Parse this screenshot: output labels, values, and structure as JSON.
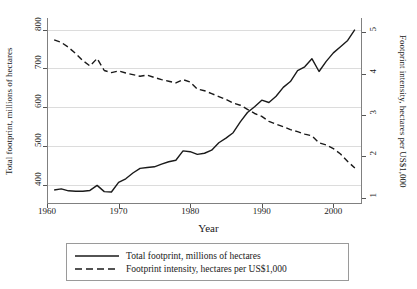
{
  "chart_data": {
    "type": "line",
    "title": "",
    "xlabel": "Year",
    "ylabel": "Total footprint, millions of hectares",
    "ylabel_right": "Footprint intensity, hectares per US$1,000",
    "xlim": [
      1960,
      2004
    ],
    "ylim": [
      350,
      830
    ],
    "ylim_right": [
      0.85,
      5.35
    ],
    "xticks": [
      1960,
      1970,
      1980,
      1990,
      2000
    ],
    "yticks": [
      400,
      500,
      600,
      700,
      800
    ],
    "yticks_right": [
      1,
      2,
      3,
      4,
      5
    ],
    "grid": true,
    "legend_position": "below-center",
    "x": [
      1961,
      1962,
      1963,
      1964,
      1965,
      1966,
      1967,
      1968,
      1969,
      1970,
      1971,
      1972,
      1973,
      1974,
      1975,
      1976,
      1977,
      1978,
      1979,
      1980,
      1981,
      1982,
      1983,
      1984,
      1985,
      1986,
      1987,
      1988,
      1989,
      1990,
      1991,
      1992,
      1993,
      1994,
      1995,
      1996,
      1997,
      1998,
      1999,
      2000,
      2001,
      2002,
      2003
    ],
    "series": [
      {
        "name": "Total footprint, millions of hectares",
        "style": "solid",
        "axis": "left",
        "color": "#1a1a1a",
        "values": [
          386,
          389,
          384,
          383,
          383,
          385,
          398,
          382,
          381,
          406,
          415,
          430,
          442,
          444,
          446,
          453,
          459,
          463,
          487,
          485,
          478,
          481,
          489,
          508,
          520,
          534,
          562,
          586,
          601,
          618,
          612,
          628,
          651,
          666,
          694,
          704,
          725,
          692,
          718,
          740,
          756,
          772,
          800
        ]
      },
      {
        "name": "Footprint intensity, hectares per US$1,000",
        "style": "dashed",
        "axis": "right",
        "color": "#1a1a1a",
        "values": [
          4.82,
          4.76,
          4.64,
          4.49,
          4.32,
          4.19,
          4.37,
          4.08,
          4.03,
          4.07,
          4.02,
          3.98,
          3.94,
          3.97,
          3.91,
          3.86,
          3.82,
          3.78,
          3.86,
          3.8,
          3.63,
          3.59,
          3.52,
          3.45,
          3.38,
          3.29,
          3.24,
          3.14,
          3.04,
          2.97,
          2.85,
          2.78,
          2.72,
          2.65,
          2.6,
          2.54,
          2.5,
          2.33,
          2.28,
          2.19,
          2.06,
          1.88,
          1.72
        ]
      }
    ],
    "legend": [
      {
        "label": "Total footprint, millions of hectares",
        "style": "solid"
      },
      {
        "label": "Footprint intensity, hectares per US$1,000",
        "style": "dashed"
      }
    ]
  }
}
